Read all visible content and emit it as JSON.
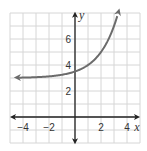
{
  "chart_data": {
    "type": "line",
    "title": "",
    "xlabel": "x",
    "ylabel": "y",
    "xlim": [
      -5,
      5
    ],
    "ylim": [
      -2,
      8
    ],
    "grid": true,
    "x_ticks": [
      {
        "value": -4,
        "label": "−4"
      },
      {
        "value": -2,
        "label": "−2"
      },
      {
        "value": 2,
        "label": "2"
      },
      {
        "value": 4,
        "label": "4"
      }
    ],
    "y_ticks": [
      {
        "value": 2,
        "label": "2"
      },
      {
        "value": 4,
        "label": "4"
      },
      {
        "value": 6,
        "label": "6"
      }
    ],
    "series": [
      {
        "name": "exponential curve",
        "function": "y = 0.5·2^x + 3",
        "asymptote": 3,
        "x": [
          -4.5,
          -4,
          -3,
          -2,
          -1,
          0,
          1,
          2,
          3,
          3.4
        ],
        "y": [
          3.02,
          3.03,
          3.06,
          3.13,
          3.25,
          3.5,
          4,
          5,
          7,
          8.3
        ],
        "arrows_both_ends": true,
        "color": "#6b6b6b"
      }
    ]
  },
  "axes": {
    "x_label": "x",
    "y_label": "y",
    "axis_color": "#222222",
    "grid_color": "#d6d6d6"
  }
}
